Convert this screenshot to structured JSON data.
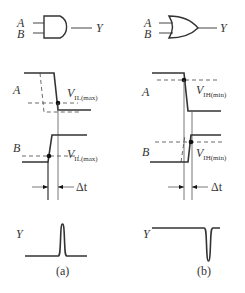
{
  "panels": [
    {
      "id": "a",
      "gate": "AND",
      "inputs": [
        "A",
        "B"
      ],
      "output": "Y",
      "signal_a_label": "A",
      "signal_b_label": "B",
      "threshold_a": {
        "main": "V",
        "sub": "IL(max)"
      },
      "threshold_b": {
        "main": "V",
        "sub": "IL(max)"
      },
      "delta_label": "Δt",
      "output_label": "Y",
      "output_glitch": "positive pulse",
      "caption": "(a)"
    },
    {
      "id": "b",
      "gate": "OR",
      "inputs": [
        "A",
        "B"
      ],
      "output": "Y",
      "signal_a_label": "A",
      "signal_b_label": "B",
      "threshold_a": {
        "main": "V",
        "sub": "IH(min)"
      },
      "threshold_b": {
        "main": "V",
        "sub": "IH(min)"
      },
      "delta_label": "Δt",
      "output_label": "Y",
      "output_glitch": "negative pulse",
      "caption": "(b)"
    }
  ],
  "colors": {
    "stroke": "#333333",
    "background": "#ffffff"
  }
}
